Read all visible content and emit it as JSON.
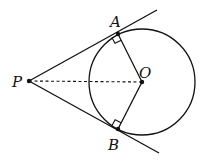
{
  "diagram": {
    "labels": {
      "P": "P",
      "A": "A",
      "O": "O",
      "B": "B"
    },
    "points": {
      "P": [
        29,
        81
      ],
      "A": [
        118,
        34
      ],
      "B": [
        118,
        129
      ],
      "O": [
        142,
        82
      ]
    },
    "circle": {
      "center": "O",
      "radius": 53
    },
    "segments": [
      {
        "name": "tangent-PA",
        "from": "P",
        "to": "A",
        "style": "solid",
        "extended": true
      },
      {
        "name": "tangent-PB",
        "from": "P",
        "to": "B",
        "style": "solid",
        "extended": true
      },
      {
        "name": "radius-OA",
        "from": "O",
        "to": "A",
        "style": "solid"
      },
      {
        "name": "radius-OB",
        "from": "O",
        "to": "B",
        "style": "solid"
      },
      {
        "name": "segment-PO",
        "from": "P",
        "to": "O",
        "style": "dashed"
      }
    ],
    "right_angles": [
      "A",
      "B"
    ],
    "stroke_color": "#111111"
  }
}
